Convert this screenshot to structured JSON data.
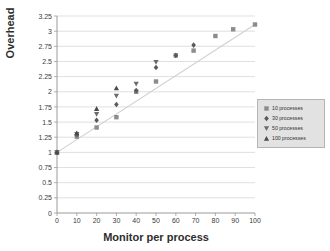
{
  "chart_data": {
    "type": "scatter",
    "title": "",
    "xlabel": "Monitor per process",
    "ylabel": "Overhead",
    "xlim": [
      0,
      100
    ],
    "ylim": [
      0,
      3.25
    ],
    "xticks": [
      0,
      10,
      20,
      30,
      40,
      50,
      60,
      70,
      80,
      90,
      100
    ],
    "yticks": [
      0,
      0.25,
      0.5,
      0.75,
      1,
      1.25,
      1.5,
      1.75,
      2,
      2.25,
      2.5,
      2.75,
      3,
      3.25
    ],
    "xtick_labels": [
      "0",
      "10",
      "20",
      "30",
      "40",
      "50",
      "60",
      "70",
      "80",
      "90",
      "100"
    ],
    "ytick_labels": [
      "0",
      "0.25",
      "0.5",
      "0.75",
      "1",
      "1.25",
      "1.5",
      "1.75",
      "2",
      "2.25",
      "2.5",
      "2.75",
      "3",
      "3.25"
    ],
    "grid": "horizontal",
    "legend_position": "right",
    "trendline": true,
    "series": [
      {
        "name": "10 processes",
        "marker": "square",
        "color": "#8c8c8c",
        "points": [
          {
            "x": 0,
            "y": 1.0
          },
          {
            "x": 10,
            "y": 1.26
          },
          {
            "x": 20,
            "y": 1.41
          },
          {
            "x": 30,
            "y": 1.58
          },
          {
            "x": 40,
            "y": 2.0
          },
          {
            "x": 50,
            "y": 2.17
          },
          {
            "x": 60,
            "y": 2.6
          },
          {
            "x": 69,
            "y": 2.68
          },
          {
            "x": 80,
            "y": 2.92
          },
          {
            "x": 89,
            "y": 3.03
          },
          {
            "x": 100,
            "y": 3.11
          }
        ]
      },
      {
        "name": "30 processes",
        "marker": "diamond",
        "color": "#5a5a5a",
        "points": [
          {
            "x": 0,
            "y": 1.0
          },
          {
            "x": 10,
            "y": 1.29
          },
          {
            "x": 20,
            "y": 1.53
          },
          {
            "x": 30,
            "y": 1.79
          },
          {
            "x": 40,
            "y": 2.02
          },
          {
            "x": 50,
            "y": 2.4
          },
          {
            "x": 60,
            "y": 2.6
          },
          {
            "x": 69,
            "y": 2.77
          }
        ]
      },
      {
        "name": "50 processes",
        "marker": "triangle-down",
        "color": "#6b6b6b",
        "points": [
          {
            "x": 0,
            "y": 1.0
          },
          {
            "x": 10,
            "y": 1.3
          },
          {
            "x": 20,
            "y": 1.63
          },
          {
            "x": 30,
            "y": 1.93
          },
          {
            "x": 40,
            "y": 2.13
          },
          {
            "x": 50,
            "y": 2.49
          }
        ]
      },
      {
        "name": "100 processes",
        "marker": "triangle-up",
        "color": "#4a4a4a",
        "points": [
          {
            "x": 0,
            "y": 1.0
          },
          {
            "x": 10,
            "y": 1.32
          },
          {
            "x": 20,
            "y": 1.72
          },
          {
            "x": 30,
            "y": 2.06
          }
        ]
      }
    ]
  }
}
